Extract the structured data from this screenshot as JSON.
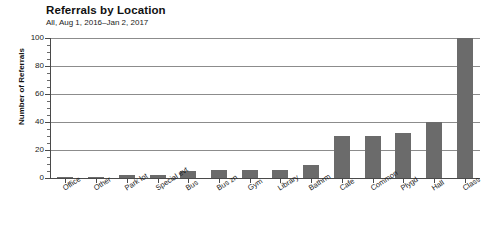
{
  "chart_data": {
    "type": "bar",
    "title": "Referrals by Location",
    "subtitle": "All, Aug 1, 2016–Jan 2, 2017",
    "xlabel": "",
    "ylabel": "Number of Referrals",
    "ylim": [
      0,
      100
    ],
    "yticks": [
      0,
      20,
      40,
      60,
      80,
      100
    ],
    "ytick_labels": [
      "0",
      "20",
      "40",
      "60",
      "80",
      "100"
    ],
    "grid": true,
    "legend": false,
    "bar_color": "#6b6b6b",
    "categories": [
      "Office",
      "Other",
      "Park lot",
      "Special evt",
      "Bus",
      "Bus zn",
      "Gym",
      "Library",
      "Bathrm",
      "Cafe",
      "Common",
      "Plygd",
      "Hall",
      "Class"
    ],
    "values": [
      1,
      1,
      2,
      2,
      5,
      6,
      6,
      6,
      9,
      30,
      30,
      32,
      40,
      100
    ]
  }
}
